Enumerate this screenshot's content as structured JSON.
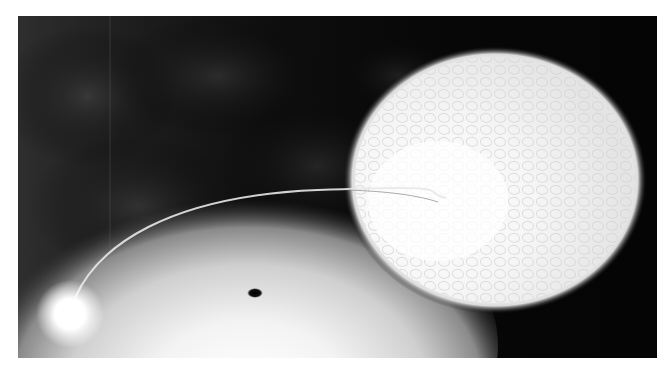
{
  "image": {
    "subject": "Artist illustration of a binary system: a black hole with a bright accretion disc drawing a gas stream from a large companion star",
    "palette": {
      "background": "#000000",
      "nebula": "#2a2a2a",
      "star": "#ffffff",
      "disc": "#f4f4f4",
      "black_hole": "#0a0a0a",
      "frame": "#ffffff"
    },
    "elements": {
      "companion_star": {
        "cx": 477,
        "cy": 164,
        "rx": 148,
        "ry": 130
      },
      "accretion_disc": {
        "cx": 230,
        "cy": 330,
        "rx": 220,
        "ry": 140
      },
      "black_hole": {
        "cx": 237,
        "cy": 277,
        "rx": 7,
        "ry": 4
      },
      "hot_spot": {
        "cx": 52,
        "cy": 298,
        "r": 28
      },
      "gas_stream": "M 57 282 C 80 230, 150 180, 300 174 S 400 176, 428 182"
    }
  }
}
